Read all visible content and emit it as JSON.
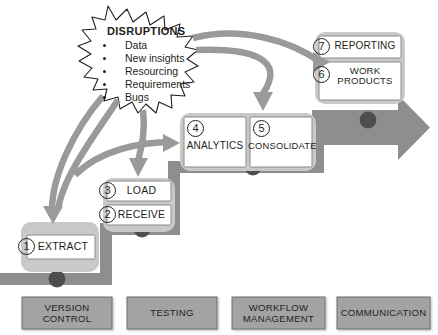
{
  "diagram": {
    "colors": {
      "stair_fill": "#8e8e8e",
      "stair_dot": "#4d4d4d",
      "panel_shadow": "#c7c7c7",
      "card_fill": "#ffffff",
      "arrow_gray": "#9a9a9a",
      "foot_fill": "#a3a3a3",
      "outline": "#8a8a8a",
      "text": "#231f20"
    }
  },
  "disruptions": {
    "title": "DISRUPTIONS",
    "items": [
      "Data",
      "New insights",
      "Resourcing",
      "Requirements",
      "Bugs"
    ]
  },
  "steps": [
    {
      "number": "1",
      "label": "EXTRACT"
    },
    {
      "number": "2",
      "label": "RECEIVE"
    },
    {
      "number": "3",
      "label": "LOAD"
    },
    {
      "number": "4",
      "label": "ANALYTICS"
    },
    {
      "number": "5",
      "label": "CONSOLIDATE"
    },
    {
      "number": "6",
      "label": "WORK PRODUCTS",
      "line1": "WORK",
      "line2": "PRODUCTS"
    },
    {
      "number": "7",
      "label": "REPORTING"
    }
  ],
  "foundations": [
    {
      "label": "VERSION CONTROL",
      "line1": "VERSION",
      "line2": "CONTROL"
    },
    {
      "label": "TESTING",
      "line1": "TESTING",
      "line2": ""
    },
    {
      "label": "WORKFLOW MANAGEMENT",
      "line1": "WORKFLOW",
      "line2": "MANAGEMENT"
    },
    {
      "label": "COMMUNICATION",
      "line1": "COMMUNICATION",
      "line2": ""
    }
  ]
}
